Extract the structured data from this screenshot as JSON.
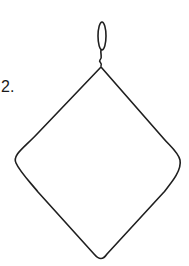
{
  "figure": {
    "step_label": "2.",
    "stroke_color": "#1f1f1f"
  }
}
